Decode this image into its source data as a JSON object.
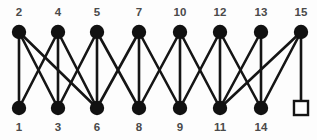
{
  "figure": {
    "background_color": "#fdfdfd",
    "edge_color": "#151515",
    "node_color": "#111111",
    "label_color": "#4a4a4a"
  },
  "chart_data": {
    "type": "diagram",
    "diagram_type": "bipartite-graph",
    "title": "",
    "xlabel": "",
    "ylabel": "",
    "grid": false,
    "legend": null,
    "layout": {
      "rows": 2,
      "top_row_y": 32,
      "bottom_row_y": 108,
      "columns_x": [
        19,
        58,
        97,
        139,
        180,
        220,
        261,
        301
      ],
      "top_label_y": 13,
      "bottom_label_y": 128,
      "node_radius": 7.2
    },
    "nodes": [
      {
        "id": "t1",
        "label": "2",
        "row": "top",
        "column": 0,
        "x": 19,
        "y": 32,
        "shape": "circle"
      },
      {
        "id": "t2",
        "label": "4",
        "row": "top",
        "column": 1,
        "x": 58,
        "y": 32,
        "shape": "circle"
      },
      {
        "id": "t3",
        "label": "5",
        "row": "top",
        "column": 2,
        "x": 97,
        "y": 32,
        "shape": "circle"
      },
      {
        "id": "t4",
        "label": "7",
        "row": "top",
        "column": 3,
        "x": 139,
        "y": 32,
        "shape": "circle"
      },
      {
        "id": "t5",
        "label": "10",
        "row": "top",
        "column": 4,
        "x": 180,
        "y": 32,
        "shape": "circle"
      },
      {
        "id": "t6",
        "label": "12",
        "row": "top",
        "column": 5,
        "x": 220,
        "y": 32,
        "shape": "circle"
      },
      {
        "id": "t7",
        "label": "13",
        "row": "top",
        "column": 6,
        "x": 261,
        "y": 32,
        "shape": "circle"
      },
      {
        "id": "t8",
        "label": "15",
        "row": "top",
        "column": 7,
        "x": 301,
        "y": 32,
        "shape": "circle"
      },
      {
        "id": "b1",
        "label": "1",
        "row": "bottom",
        "column": 0,
        "x": 19,
        "y": 108,
        "shape": "circle"
      },
      {
        "id": "b2",
        "label": "3",
        "row": "bottom",
        "column": 1,
        "x": 58,
        "y": 108,
        "shape": "circle"
      },
      {
        "id": "b3",
        "label": "6",
        "row": "bottom",
        "column": 2,
        "x": 97,
        "y": 108,
        "shape": "circle"
      },
      {
        "id": "b4",
        "label": "8",
        "row": "bottom",
        "column": 3,
        "x": 139,
        "y": 108,
        "shape": "circle"
      },
      {
        "id": "b5",
        "label": "9",
        "row": "bottom",
        "column": 4,
        "x": 180,
        "y": 108,
        "shape": "circle"
      },
      {
        "id": "b6",
        "label": "11",
        "row": "bottom",
        "column": 5,
        "x": 220,
        "y": 108,
        "shape": "circle"
      },
      {
        "id": "b7",
        "label": "14",
        "row": "bottom",
        "column": 6,
        "x": 261,
        "y": 108,
        "shape": "circle"
      },
      {
        "id": "b8",
        "label": "",
        "row": "bottom",
        "column": 7,
        "x": 301,
        "y": 108,
        "shape": "square"
      }
    ],
    "edges": [
      {
        "source": "t1",
        "target": "b1"
      },
      {
        "source": "t1",
        "target": "b2"
      },
      {
        "source": "t1",
        "target": "b3"
      },
      {
        "source": "t2",
        "target": "b2"
      },
      {
        "source": "t2",
        "target": "b1"
      },
      {
        "source": "t2",
        "target": "b3"
      },
      {
        "source": "t3",
        "target": "b3"
      },
      {
        "source": "t3",
        "target": "b2"
      },
      {
        "source": "t3",
        "target": "b4"
      },
      {
        "source": "t4",
        "target": "b4"
      },
      {
        "source": "t4",
        "target": "b3"
      },
      {
        "source": "t4",
        "target": "b5"
      },
      {
        "source": "t5",
        "target": "b5"
      },
      {
        "source": "t5",
        "target": "b4"
      },
      {
        "source": "t5",
        "target": "b6"
      },
      {
        "source": "t6",
        "target": "b6"
      },
      {
        "source": "t6",
        "target": "b5"
      },
      {
        "source": "t6",
        "target": "b7"
      },
      {
        "source": "t7",
        "target": "b7"
      },
      {
        "source": "t7",
        "target": "b6"
      },
      {
        "source": "t8",
        "target": "b8"
      },
      {
        "source": "t8",
        "target": "b7"
      },
      {
        "source": "t8",
        "target": "b6"
      }
    ]
  }
}
